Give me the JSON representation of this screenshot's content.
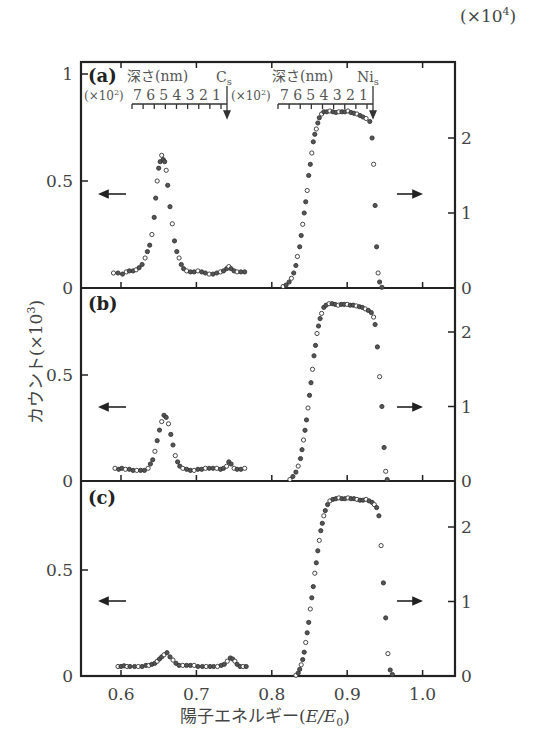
{
  "chart_data": {
    "type": "scatter",
    "title": "",
    "xlabel": "陽子エネルギー(E/E₀)",
    "ylabel_left": "カウント(×10³)",
    "ylabel_right": "(×10⁴)",
    "xlim": [
      0.545,
      1.043
    ],
    "x_ticks": [
      0.6,
      0.7,
      0.8,
      0.9,
      1.0
    ],
    "x_tick_labels": [
      "0.6",
      "0.7",
      "0.8",
      "0.9",
      "1.0"
    ],
    "depth_scale": {
      "label": "深さ(nm)",
      "multiplier": "(×10²)",
      "ticks": [
        "7",
        "6",
        "5",
        "4",
        "3",
        "2",
        "1"
      ],
      "markers": [
        {
          "element": "Cs",
          "label": "C",
          "sub": "s",
          "E": 0.738
        },
        {
          "element": "Ni",
          "label": "Ni",
          "sub": "s",
          "E": 0.933
        }
      ]
    },
    "panels": [
      {
        "label": "(a)",
        "left_axis": {
          "ylim": [
            0,
            1.05
          ],
          "ticks": [
            0,
            0.5,
            1
          ],
          "tick_labels": [
            "0",
            "0.5",
            "1"
          ]
        },
        "right_axis": {
          "ylim": [
            0,
            3.0
          ],
          "ticks": [
            0,
            1,
            2
          ],
          "tick_labels": [
            "0",
            "1",
            "2"
          ]
        },
        "series": [
          {
            "name": "Cs (left axis, ×10³)",
            "axis": "left",
            "x": [
              0.59,
              0.596,
              0.602,
              0.607,
              0.611,
              0.616,
              0.62,
              0.624,
              0.628,
              0.632,
              0.635,
              0.638,
              0.641,
              0.644,
              0.646,
              0.648,
              0.65,
              0.652,
              0.654,
              0.656,
              0.658,
              0.66,
              0.662,
              0.665,
              0.668,
              0.671,
              0.674,
              0.677,
              0.68,
              0.683,
              0.687,
              0.692,
              0.697,
              0.702,
              0.707,
              0.712,
              0.717,
              0.722,
              0.727,
              0.732,
              0.736,
              0.74,
              0.743,
              0.746,
              0.75,
              0.754,
              0.759,
              0.764
            ],
            "y": [
              0.07,
              0.07,
              0.065,
              0.075,
              0.08,
              0.08,
              0.085,
              0.095,
              0.11,
              0.14,
              0.17,
              0.2,
              0.25,
              0.33,
              0.42,
              0.5,
              0.56,
              0.59,
              0.62,
              0.6,
              0.59,
              0.55,
              0.48,
              0.38,
              0.3,
              0.22,
              0.17,
              0.14,
              0.11,
              0.09,
              0.08,
              0.075,
              0.075,
              0.08,
              0.075,
              0.07,
              0.065,
              0.065,
              0.07,
              0.075,
              0.08,
              0.09,
              0.1,
              0.09,
              0.08,
              0.075,
              0.075,
              0.075
            ]
          },
          {
            "name": "Ni (right axis, ×10⁴)",
            "axis": "right",
            "x": [
              0.815,
              0.819,
              0.823,
              0.826,
              0.829,
              0.832,
              0.834,
              0.837,
              0.839,
              0.841,
              0.843,
              0.845,
              0.847,
              0.849,
              0.851,
              0.853,
              0.855,
              0.857,
              0.859,
              0.861,
              0.863,
              0.866,
              0.869,
              0.873,
              0.877,
              0.881,
              0.885,
              0.889,
              0.893,
              0.897,
              0.901,
              0.905,
              0.909,
              0.913,
              0.917,
              0.921,
              0.925,
              0.93,
              0.933,
              0.935,
              0.937,
              0.939,
              0.941,
              0.943,
              0.946
            ],
            "y": [
              0.02,
              0.04,
              0.08,
              0.13,
              0.2,
              0.3,
              0.42,
              0.55,
              0.7,
              0.85,
              1.0,
              1.15,
              1.3,
              1.5,
              1.65,
              1.8,
              1.95,
              2.05,
              2.12,
              2.2,
              2.27,
              2.32,
              2.35,
              2.35,
              2.36,
              2.35,
              2.34,
              2.35,
              2.35,
              2.35,
              2.36,
              2.34,
              2.33,
              2.32,
              2.3,
              2.28,
              2.26,
              2.22,
              2.0,
              1.65,
              1.1,
              0.55,
              0.2,
              0.08,
              0.01
            ]
          }
        ]
      },
      {
        "label": "(b)",
        "left_axis": {
          "ylim": [
            0,
            0.91
          ],
          "ticks": [
            0,
            0.5
          ],
          "tick_labels": [
            "0",
            "0.5"
          ]
        },
        "right_axis": {
          "ylim": [
            0,
            2.6
          ],
          "ticks": [
            0,
            1,
            2
          ],
          "tick_labels": [
            "0",
            "1",
            "2"
          ]
        },
        "series": [
          {
            "name": "Cs (left axis, ×10³)",
            "axis": "left",
            "x": [
              0.592,
              0.597,
              0.601,
              0.606,
              0.611,
              0.616,
              0.621,
              0.626,
              0.631,
              0.636,
              0.639,
              0.642,
              0.645,
              0.648,
              0.651,
              0.654,
              0.657,
              0.66,
              0.663,
              0.666,
              0.669,
              0.672,
              0.675,
              0.678,
              0.682,
              0.687,
              0.692,
              0.697,
              0.702,
              0.707,
              0.712,
              0.717,
              0.722,
              0.727,
              0.732,
              0.736,
              0.74,
              0.743,
              0.746,
              0.75,
              0.754,
              0.759,
              0.764
            ],
            "y": [
              0.06,
              0.055,
              0.06,
              0.055,
              0.055,
              0.05,
              0.05,
              0.05,
              0.05,
              0.06,
              0.08,
              0.1,
              0.14,
              0.19,
              0.24,
              0.28,
              0.31,
              0.3,
              0.27,
              0.22,
              0.17,
              0.12,
              0.09,
              0.07,
              0.06,
              0.055,
              0.05,
              0.05,
              0.055,
              0.055,
              0.06,
              0.06,
              0.06,
              0.06,
              0.055,
              0.06,
              0.07,
              0.09,
              0.08,
              0.06,
              0.055,
              0.055,
              0.06
            ]
          },
          {
            "name": "Ni (right axis, ×10⁴)",
            "axis": "right",
            "x": [
              0.824,
              0.828,
              0.832,
              0.835,
              0.838,
              0.84,
              0.842,
              0.844,
              0.846,
              0.848,
              0.85,
              0.852,
              0.854,
              0.856,
              0.858,
              0.86,
              0.862,
              0.864,
              0.866,
              0.869,
              0.872,
              0.876,
              0.88,
              0.884,
              0.888,
              0.892,
              0.896,
              0.9,
              0.904,
              0.908,
              0.912,
              0.916,
              0.92,
              0.924,
              0.928,
              0.932,
              0.935,
              0.937,
              0.94,
              0.943,
              0.946,
              0.949,
              0.951,
              0.953
            ],
            "y": [
              0.02,
              0.06,
              0.12,
              0.2,
              0.3,
              0.42,
              0.55,
              0.68,
              0.82,
              0.98,
              1.15,
              1.32,
              1.5,
              1.68,
              1.82,
              1.98,
              2.08,
              2.18,
              2.25,
              2.33,
              2.36,
              2.38,
              2.38,
              2.37,
              2.36,
              2.37,
              2.37,
              2.37,
              2.36,
              2.36,
              2.35,
              2.34,
              2.33,
              2.31,
              2.29,
              2.26,
              2.2,
              2.1,
              1.8,
              1.4,
              1.0,
              0.45,
              0.13,
              0.02
            ]
          }
        ]
      },
      {
        "label": "(c)",
        "left_axis": {
          "ylim": [
            0,
            0.92
          ],
          "ticks": [
            0,
            0.5
          ],
          "tick_labels": [
            "0",
            "0.5"
          ]
        },
        "right_axis": {
          "ylim": [
            0,
            2.62
          ],
          "ticks": [
            0,
            1,
            2
          ],
          "tick_labels": [
            "0",
            "1",
            "2"
          ]
        },
        "series": [
          {
            "name": "Cs (left axis, ×10³)",
            "axis": "left",
            "x": [
              0.596,
              0.6,
              0.604,
              0.608,
              0.612,
              0.618,
              0.623,
              0.628,
              0.633,
              0.637,
              0.641,
              0.645,
              0.648,
              0.651,
              0.654,
              0.657,
              0.661,
              0.665,
              0.669,
              0.673,
              0.677,
              0.682,
              0.687,
              0.692,
              0.697,
              0.702,
              0.708,
              0.713,
              0.718,
              0.723,
              0.728,
              0.733,
              0.737,
              0.741,
              0.745,
              0.748,
              0.751,
              0.754,
              0.758,
              0.762,
              0.766
            ],
            "y": [
              0.045,
              0.045,
              0.048,
              0.045,
              0.045,
              0.045,
              0.045,
              0.045,
              0.05,
              0.05,
              0.055,
              0.06,
              0.07,
              0.08,
              0.09,
              0.1,
              0.11,
              0.09,
              0.075,
              0.06,
              0.05,
              0.05,
              0.05,
              0.05,
              0.05,
              0.045,
              0.045,
              0.045,
              0.045,
              0.045,
              0.045,
              0.05,
              0.055,
              0.07,
              0.085,
              0.08,
              0.07,
              0.055,
              0.045,
              0.045,
              0.045
            ]
          },
          {
            "name": "Ni (right axis, ×10⁴)",
            "axis": "right",
            "x": [
              0.832,
              0.835,
              0.837,
              0.839,
              0.841,
              0.843,
              0.845,
              0.847,
              0.849,
              0.851,
              0.853,
              0.855,
              0.857,
              0.859,
              0.861,
              0.863,
              0.865,
              0.867,
              0.869,
              0.871,
              0.874,
              0.877,
              0.881,
              0.885,
              0.889,
              0.893,
              0.897,
              0.901,
              0.905,
              0.909,
              0.913,
              0.917,
              0.921,
              0.925,
              0.929,
              0.933,
              0.936,
              0.939,
              0.942,
              0.945,
              0.948,
              0.951,
              0.954,
              0.957,
              0.96
            ],
            "y": [
              0.01,
              0.04,
              0.09,
              0.15,
              0.22,
              0.32,
              0.45,
              0.58,
              0.72,
              0.9,
              1.05,
              1.2,
              1.38,
              1.52,
              1.68,
              1.82,
              1.95,
              2.05,
              2.15,
              2.22,
              2.3,
              2.35,
              2.37,
              2.38,
              2.39,
              2.38,
              2.38,
              2.39,
              2.38,
              2.38,
              2.37,
              2.36,
              2.36,
              2.37,
              2.35,
              2.33,
              2.3,
              2.26,
              2.15,
              1.75,
              1.25,
              0.78,
              0.3,
              0.08,
              0.02
            ]
          }
        ]
      }
    ],
    "arrows": [
      {
        "panel": "(a)",
        "direction": "left",
        "meaning": "Cs data on left axis"
      },
      {
        "panel": "(a)",
        "direction": "right",
        "meaning": "Ni data on right axis"
      },
      {
        "panel": "(b)",
        "direction": "left"
      },
      {
        "panel": "(b)",
        "direction": "right"
      },
      {
        "panel": "(c)",
        "direction": "left"
      },
      {
        "panel": "(c)",
        "direction": "right"
      }
    ]
  },
  "labels": {
    "panel_a": "(a)",
    "panel_b": "(b)",
    "panel_c": "(c)",
    "depth_cs": "深さ(nm)",
    "depth_ni": "深さ(nm)",
    "cs_symbol": "C",
    "cs_sub": "s",
    "ni_symbol": "Ni",
    "ni_sub": "s",
    "mult": "(×10",
    "mult_exp": "2",
    "mult_close": ")",
    "depth_digits": "7 6 5 4 3 2 1",
    "right_unit": "(×10",
    "right_unit_exp": "4",
    "right_unit_close": ")",
    "ylabel": "カウント(×10",
    "ylabel_exp": "3",
    "ylabel_close": ")",
    "xlabel": "陽子エネルギー(",
    "xlabel_var": "E/E",
    "xlabel_sub": "0",
    "xlabel_close": ")"
  }
}
